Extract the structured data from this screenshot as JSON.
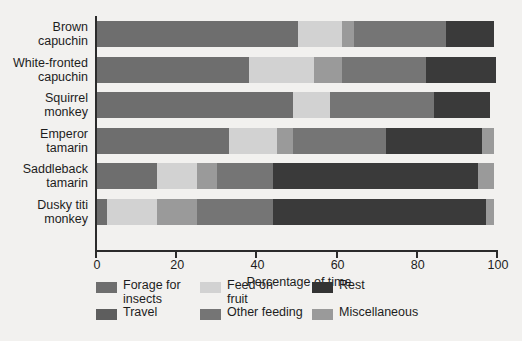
{
  "chart_data": {
    "type": "bar",
    "orientation": "horizontal",
    "stacked": true,
    "title": "",
    "xlabel": "Percentage of time",
    "ylabel": "",
    "xlim": [
      0,
      100
    ],
    "xticks": [
      0,
      20,
      40,
      60,
      80,
      100
    ],
    "xtick_labels": [
      "0",
      "20",
      "40",
      "60",
      "80",
      "100"
    ],
    "grid": false,
    "legend_position": "bottom",
    "categories": [
      "Brown capuchin",
      "White-fronted capuchin",
      "Squirrel monkey",
      "Emperor tamarin",
      "Saddleback tamarin",
      "Dusky titi monkey"
    ],
    "category_lines": [
      [
        "Brown",
        "capuchin"
      ],
      [
        "White-fronted",
        "capuchin"
      ],
      [
        "Squirrel",
        "monkey"
      ],
      [
        "Emperor",
        "tamarin"
      ],
      [
        "Saddleback",
        "tamarin"
      ],
      [
        "Dusky titi",
        "monkey"
      ]
    ],
    "series": [
      {
        "name": "Forage for insects",
        "color": "#6e6e6e",
        "values": [
          50,
          38,
          49,
          33,
          15,
          2.5
        ]
      },
      {
        "name": "Feed on fruit",
        "color": "#d2d2d2",
        "values": [
          11,
          16,
          9,
          12,
          10,
          12.5
        ]
      },
      {
        "name": "Miscellaneous",
        "color": "#9a9a9a",
        "values": [
          3,
          7,
          0,
          4,
          5,
          10
        ]
      },
      {
        "name": "Other feeding",
        "color": "#757575",
        "values": [
          23,
          21,
          26,
          23,
          14,
          19
        ]
      },
      {
        "name": "Rest",
        "color": "#3a3a3a",
        "values": [
          12,
          17.5,
          14,
          24,
          51,
          53
        ]
      },
      {
        "name": "Travel",
        "color": "#5e5e5e",
        "values": [
          0,
          0,
          0,
          3,
          4,
          2
        ]
      }
    ],
    "bars": [
      {
        "category": "Brown capuchin",
        "segments": [
          {
            "label": "Forage for insects",
            "value": 50,
            "color": "#6e6e6e"
          },
          {
            "label": "Feed on fruit",
            "value": 11,
            "color": "#d2d2d2"
          },
          {
            "label": "Miscellaneous",
            "value": 3,
            "color": "#9a9a9a"
          },
          {
            "label": "Other feeding",
            "value": 23,
            "color": "#757575"
          },
          {
            "label": "Rest",
            "value": 12,
            "color": "#3a3a3a"
          }
        ]
      },
      {
        "category": "White-fronted capuchin",
        "segments": [
          {
            "label": "Forage for insects",
            "value": 38,
            "color": "#6e6e6e"
          },
          {
            "label": "Feed on fruit",
            "value": 16,
            "color": "#d2d2d2"
          },
          {
            "label": "Miscellaneous",
            "value": 7,
            "color": "#9a9a9a"
          },
          {
            "label": "Other feeding",
            "value": 21,
            "color": "#757575"
          },
          {
            "label": "Rest",
            "value": 17.5,
            "color": "#3a3a3a"
          }
        ]
      },
      {
        "category": "Squirrel monkey",
        "segments": [
          {
            "label": "Forage for insects",
            "value": 49,
            "color": "#6e6e6e"
          },
          {
            "label": "Feed on fruit",
            "value": 9,
            "color": "#d2d2d2"
          },
          {
            "label": "Other feeding",
            "value": 26,
            "color": "#757575"
          },
          {
            "label": "Rest",
            "value": 14,
            "color": "#3a3a3a"
          }
        ]
      },
      {
        "category": "Emperor tamarin",
        "segments": [
          {
            "label": "Forage for insects",
            "value": 33,
            "color": "#6e6e6e"
          },
          {
            "label": "Feed on fruit",
            "value": 12,
            "color": "#d2d2d2"
          },
          {
            "label": "Miscellaneous",
            "value": 4,
            "color": "#9a9a9a"
          },
          {
            "label": "Other feeding",
            "value": 23,
            "color": "#757575"
          },
          {
            "label": "Rest",
            "value": 24,
            "color": "#3a3a3a"
          },
          {
            "label": "Travel",
            "value": 3,
            "color": "#9a9a9a"
          }
        ]
      },
      {
        "category": "Saddleback tamarin",
        "segments": [
          {
            "label": "Forage for insects",
            "value": 15,
            "color": "#6e6e6e"
          },
          {
            "label": "Feed on fruit",
            "value": 10,
            "color": "#d2d2d2"
          },
          {
            "label": "Miscellaneous",
            "value": 5,
            "color": "#9a9a9a"
          },
          {
            "label": "Other feeding",
            "value": 14,
            "color": "#757575"
          },
          {
            "label": "Rest",
            "value": 51,
            "color": "#3a3a3a"
          },
          {
            "label": "Travel",
            "value": 4,
            "color": "#9a9a9a"
          }
        ]
      },
      {
        "category": "Dusky titi monkey",
        "segments": [
          {
            "label": "Forage for insects",
            "value": 2.5,
            "color": "#6e6e6e"
          },
          {
            "label": "Feed on fruit",
            "value": 12.5,
            "color": "#d2d2d2"
          },
          {
            "label": "Miscellaneous",
            "value": 10,
            "color": "#9a9a9a"
          },
          {
            "label": "Other feeding",
            "value": 19,
            "color": "#757575"
          },
          {
            "label": "Rest",
            "value": 53,
            "color": "#3a3a3a"
          },
          {
            "label": "Travel",
            "value": 2,
            "color": "#9a9a9a"
          }
        ]
      }
    ],
    "legend": [
      {
        "label_lines": [
          "Forage for",
          "insects"
        ],
        "color": "#6e6e6e"
      },
      {
        "label_lines": [
          "Feed on",
          "fruit"
        ],
        "color": "#d2d2d2"
      },
      {
        "label_lines": [
          "Rest"
        ],
        "color": "#333333"
      },
      {
        "label_lines": [
          "Travel"
        ],
        "color": "#5e5e5e"
      },
      {
        "label_lines": [
          "Other feeding"
        ],
        "color": "#757575"
      },
      {
        "label_lines": [
          "Miscellaneous"
        ],
        "color": "#9a9a9a"
      }
    ]
  }
}
